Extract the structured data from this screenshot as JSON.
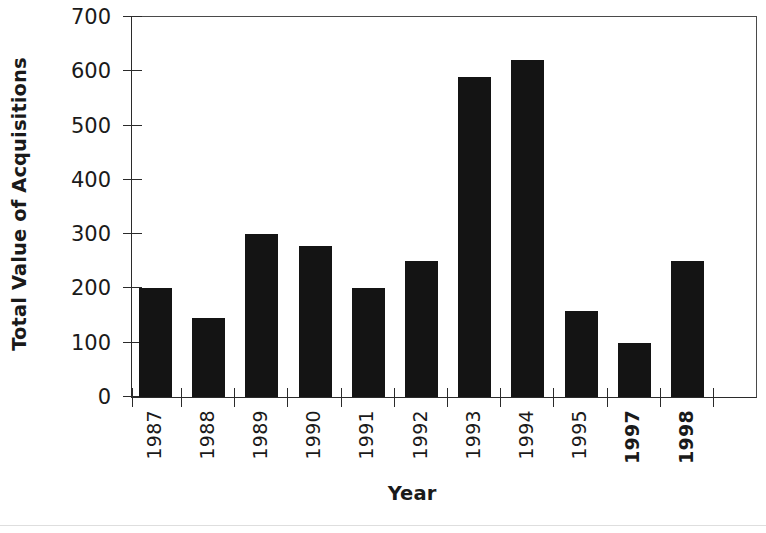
{
  "chart_data": {
    "type": "bar",
    "title": "",
    "xlabel": "Year",
    "ylabel": "Total Value of Acquisitions",
    "categories": [
      "1987",
      "1988",
      "1989",
      "1990",
      "1991",
      "1992",
      "1993",
      "1994",
      "1995",
      "1997",
      "1998"
    ],
    "values": [
      200,
      145,
      300,
      278,
      200,
      250,
      590,
      620,
      158,
      100,
      250
    ],
    "ylim": [
      0,
      700
    ],
    "ytick_labels": [
      "0",
      "100",
      "200",
      "300",
      "400",
      "500",
      "600",
      "700"
    ],
    "ytick_values": [
      0,
      100,
      200,
      300,
      400,
      500,
      600,
      700
    ],
    "grid": false,
    "legend": null,
    "bar_color": "#141414",
    "axis_color": "#2b2b2b",
    "emphasized_categories": [
      "1997",
      "1998"
    ]
  },
  "axes": {
    "y_title": "Total Value of Acquisitions",
    "x_title": "Year"
  }
}
